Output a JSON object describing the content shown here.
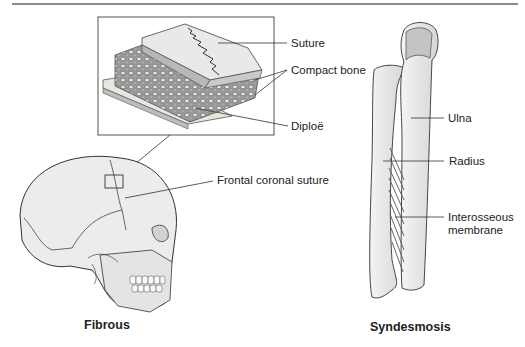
{
  "diagram": {
    "fibrous": {
      "caption": "Fibrous",
      "inset_labels": {
        "suture": "Suture",
        "compact_bone": "Compact bone",
        "diploe": "Diploë"
      },
      "skull_label": "Frontal coronal suture"
    },
    "syndesmosis": {
      "caption": "Syndesmosis",
      "labels": {
        "ulna": "Ulna",
        "radius": "Radius",
        "interosseous_line1": "Interosseous",
        "interosseous_line2": "membrane"
      }
    }
  }
}
